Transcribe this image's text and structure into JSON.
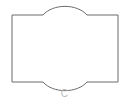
{
  "figure": {
    "caption": "C",
    "shape_name": "tessellation-tile",
    "background_color": "#ffffff",
    "stroke_color": "#6b6b6b",
    "caption_color": "#b9b9b9",
    "stroke_width": 1,
    "geometry": {
      "left": 12,
      "right": 118,
      "top": 15,
      "bottom": 82,
      "width": 106,
      "height": 67,
      "arc_start_x": 43,
      "arc_end_x": 87,
      "arc_span": 44,
      "top_arc_peak_y": 10,
      "top_arc_rise": 5,
      "bottom_arc_dip_y": 87,
      "bottom_arc_drop": 5,
      "top_arc_direction": "convex-up",
      "bottom_arc_direction": "concave-down"
    },
    "path": "M 12 15 L 43 15 C 53 3.5 77 3.5 87 15 L 118 15 L 118 82 L 87 82 C 77 93.5 53 93.5 43 82 L 12 82 Z"
  }
}
